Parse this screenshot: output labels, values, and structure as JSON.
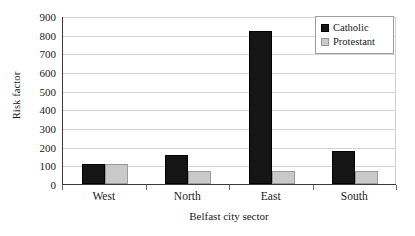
{
  "chart_data": {
    "type": "bar",
    "title": "",
    "xlabel": "Belfast city sector",
    "ylabel": "Risk factor",
    "categories": [
      "West",
      "North",
      "East",
      "South"
    ],
    "series": [
      {
        "name": "Catholic",
        "color": "#151515",
        "values": [
          105,
          155,
          818,
          175
        ]
      },
      {
        "name": "Protestant",
        "color": "#c9c9c9",
        "values": [
          105,
          70,
          70,
          70
        ]
      }
    ],
    "ylim": [
      0,
      900
    ],
    "ytick_step": 100,
    "yticks": [
      900,
      800,
      700,
      600,
      500,
      400,
      300,
      200,
      100,
      0
    ],
    "ytick_labels": [
      "900",
      "800",
      "700",
      "600",
      "500",
      "400",
      "300",
      "200",
      "100",
      "0"
    ],
    "grid": true,
    "grid_axis": "y",
    "legend": {
      "position": "top-right",
      "entries": [
        {
          "label": "Catholic",
          "swatch": "catholic"
        },
        {
          "label": "Protestant",
          "swatch": "protestant"
        }
      ]
    }
  }
}
